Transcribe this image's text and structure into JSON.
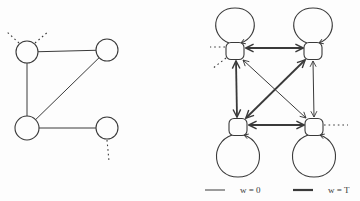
{
  "figure": {
    "background": "#fdfdfd",
    "ink": "#3a3a3a"
  },
  "left_graph": {
    "type": "undirected-graph",
    "nodes": [
      {
        "id": "TL",
        "x": 27,
        "y": 52,
        "r": 11
      },
      {
        "id": "TR",
        "x": 107,
        "y": 50,
        "r": 11
      },
      {
        "id": "BL",
        "x": 27,
        "y": 128,
        "r": 12
      },
      {
        "id": "BR",
        "x": 107,
        "y": 128,
        "r": 11
      }
    ],
    "edges": [
      {
        "from": "TL",
        "to": "TR"
      },
      {
        "from": "TL",
        "to": "BL"
      },
      {
        "from": "BL",
        "to": "TR"
      },
      {
        "from": "BL",
        "to": "BR"
      }
    ],
    "dotted_stubs": [
      {
        "x1": 19,
        "y1": 43,
        "x2": 6,
        "y2": 31
      },
      {
        "x1": 35,
        "y1": 43,
        "x2": 49,
        "y2": 31
      },
      {
        "x1": 107,
        "y1": 140,
        "x2": 109,
        "y2": 161
      }
    ]
  },
  "right_graph": {
    "type": "directed-transition-graph",
    "nodes": [
      {
        "id": "TL",
        "x": 235,
        "y": 51,
        "w": 18,
        "h": 17,
        "loop": "up"
      },
      {
        "id": "TR",
        "x": 313,
        "y": 51,
        "w": 18,
        "h": 17,
        "loop": "up"
      },
      {
        "id": "BL",
        "x": 238,
        "y": 127,
        "w": 18,
        "h": 17,
        "loop": "down"
      },
      {
        "id": "BR",
        "x": 314,
        "y": 127,
        "w": 18,
        "h": 17,
        "loop": "down"
      }
    ],
    "edges": [
      {
        "from": "TL",
        "to": "TR",
        "weight": "T",
        "x1": 246,
        "y1": 48,
        "x2": 303,
        "y2": 48
      },
      {
        "from": "BL",
        "to": "BR",
        "weight": "T",
        "x1": 249,
        "y1": 125,
        "x2": 304,
        "y2": 125
      },
      {
        "from": "TL",
        "to": "BL",
        "weight": "T",
        "x1": 236,
        "y1": 61,
        "x2": 237,
        "y2": 117
      },
      {
        "from": "TR",
        "to": "BR",
        "weight": "0",
        "x1": 313,
        "y1": 61,
        "x2": 314,
        "y2": 117
      },
      {
        "from": "BL",
        "to": "TR",
        "weight": "T",
        "x1": 246,
        "y1": 118,
        "x2": 305,
        "y2": 60
      },
      {
        "from": "TL",
        "to": "BR",
        "weight": "0",
        "x1": 243,
        "y1": 60,
        "x2": 306,
        "y2": 118
      }
    ],
    "dotted_stubs": [
      {
        "x1": 225,
        "y1": 47,
        "x2": 210,
        "y2": 47
      },
      {
        "x1": 226,
        "y1": 58,
        "x2": 212,
        "y2": 69
      },
      {
        "x1": 324,
        "y1": 125,
        "x2": 348,
        "y2": 125
      }
    ]
  },
  "legend": {
    "items": [
      {
        "label": "w = 0",
        "weight": "thin"
      },
      {
        "label": "w = T",
        "weight": "thick"
      }
    ]
  }
}
